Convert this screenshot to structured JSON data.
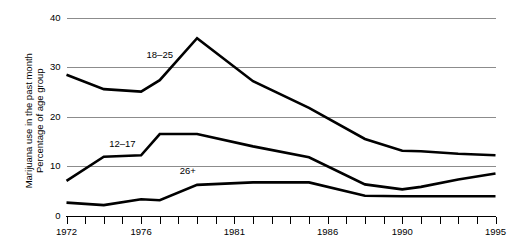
{
  "chart_data": {
    "type": "line",
    "title": "",
    "xlabel": "",
    "ylabel": "Marijuana use in the past month\nPercentage of age group",
    "ylabel_line1": "Marijuana use in the past month",
    "ylabel_line2": "Percentage of age group",
    "xlim": [
      1972,
      1995
    ],
    "ylim": [
      0,
      40
    ],
    "yticks": [
      0,
      10,
      20,
      30,
      40
    ],
    "ytick_labels": [
      "0",
      "10",
      "20",
      "30",
      "40"
    ],
    "xticks": [
      1972,
      1973,
      1974,
      1975,
      1976,
      1977,
      1978,
      1979,
      1980,
      1981,
      1982,
      1983,
      1984,
      1985,
      1986,
      1987,
      1988,
      1989,
      1990,
      1991,
      1992,
      1993,
      1994,
      1995
    ],
    "xtick_labels_shown": [
      "1972",
      "1976",
      "1981",
      "1986",
      "1990",
      "1995"
    ],
    "grid": "horizontal",
    "legend_position": "inline-annotations",
    "x": [
      1972,
      1974,
      1976,
      1977,
      1979,
      1982,
      1985,
      1988,
      1990,
      1991,
      1993,
      1995
    ],
    "series": [
      {
        "name": "18-25",
        "label": "18–25",
        "color": "#000000",
        "values": [
          28.5,
          25.6,
          25.1,
          27.4,
          35.9,
          27.2,
          21.8,
          15.5,
          13.1,
          13.0,
          12.5,
          12.2
        ]
      },
      {
        "name": "12-17",
        "label": "12–17",
        "color": "#000000",
        "values": [
          7.0,
          11.9,
          12.2,
          16.5,
          16.5,
          14.0,
          11.8,
          6.3,
          5.3,
          5.8,
          7.3,
          8.5
        ]
      },
      {
        "name": "26+",
        "label": "26+",
        "color": "#000000",
        "values": [
          2.6,
          2.1,
          3.3,
          3.1,
          6.2,
          6.7,
          6.7,
          4.0,
          3.9,
          3.9,
          3.9,
          3.9
        ]
      }
    ],
    "annotations": [
      {
        "text": "18–25",
        "x": 1977.0,
        "y": 31.8
      },
      {
        "text": "12–17",
        "x": 1975.0,
        "y": 13.9
      },
      {
        "text": "26+",
        "x": 1978.5,
        "y": 8.4
      }
    ]
  }
}
